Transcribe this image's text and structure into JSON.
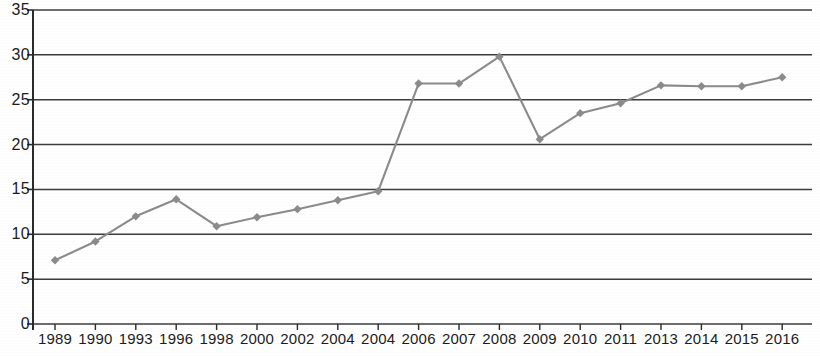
{
  "chart_data": {
    "type": "line",
    "title": "",
    "subtitle": "",
    "xlabel": "",
    "ylabel": "",
    "categories": [
      "1989",
      "1990",
      "1993",
      "1996",
      "1998",
      "2000",
      "2002",
      "2004",
      "2004",
      "2006",
      "2007",
      "2008",
      "2009",
      "2010",
      "2011",
      "2013",
      "2014",
      "2015",
      "2016"
    ],
    "values": [
      7.1,
      9.2,
      12.0,
      13.9,
      10.9,
      11.9,
      12.8,
      13.8,
      14.8,
      26.8,
      26.8,
      29.8,
      20.6,
      23.5,
      24.6,
      26.6,
      26.5,
      26.5,
      27.5
    ],
    "series": [
      {
        "name": "series-1",
        "values": [
          7.1,
          9.2,
          12.0,
          13.9,
          10.9,
          11.9,
          12.8,
          13.8,
          14.8,
          26.8,
          26.8,
          29.8,
          20.6,
          23.5,
          24.6,
          26.6,
          26.5,
          26.5,
          27.5
        ]
      }
    ],
    "ylim": [
      0,
      35
    ],
    "yticks": [
      0,
      5,
      10,
      15,
      20,
      25,
      30,
      35
    ],
    "ytick_labels": [
      "0",
      "5",
      "10",
      "15",
      "20",
      "25",
      "30",
      "35"
    ],
    "grid": true,
    "grid_axis": "y",
    "legend": "none",
    "marker": "diamond",
    "colors": {
      "line": "#8b8b8b",
      "marker": "#8b8b8b",
      "grid": "#3c3c3c",
      "axis": "#2b2b2b",
      "text": "#1c1c1c",
      "background": "#ffffff"
    }
  }
}
